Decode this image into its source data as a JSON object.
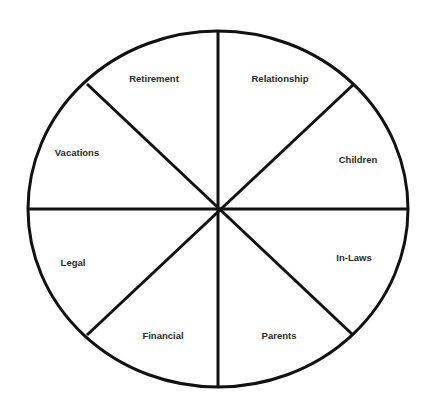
{
  "diagram": {
    "type": "wheel",
    "stroke_color": "#111111",
    "background": "#ffffff",
    "center": {
      "x": 218,
      "y": 209
    },
    "radius_x": 190,
    "radius_y": 178,
    "segments": [
      {
        "label": "Retirement",
        "x": 154,
        "y": 82
      },
      {
        "label": "Relationship",
        "x": 280,
        "y": 82
      },
      {
        "label": "Children",
        "x": 358,
        "y": 163
      },
      {
        "label": "In-Laws",
        "x": 354,
        "y": 261
      },
      {
        "label": "Parents",
        "x": 279,
        "y": 339
      },
      {
        "label": "Financial",
        "x": 163,
        "y": 339
      },
      {
        "label": "Legal",
        "x": 73,
        "y": 266
      },
      {
        "label": "Vacations",
        "x": 77,
        "y": 156
      }
    ]
  }
}
